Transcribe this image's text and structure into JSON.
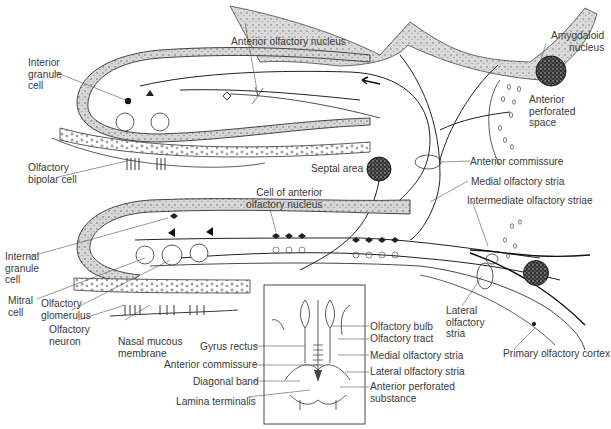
{
  "figure": {
    "background": "#ffffff",
    "ink": "#2a2a2a",
    "shade": "#d9d9d9"
  },
  "labels": {
    "anterior_olfactory_nucleus": "Anterior olfactory nucleus",
    "interior_granule_cell": [
      "Interior",
      "granule",
      "cell"
    ],
    "olfactory_bipolar_cell": [
      "Olfactory",
      "bipolar cell"
    ],
    "amygdaloid_nucleus": [
      "Amygdaloid",
      "nucleus"
    ],
    "anterior_perforated_space": [
      "Anterior",
      "perforated",
      "space"
    ],
    "septal_area": "Septal area",
    "anterior_commissure": "Anterior commissure",
    "medial_olfactory_stria": "Medial olfactory stria",
    "intermediate_olfactory_striae": "Intermediate olfactory striae",
    "cell_of_anterior_olfactory_nucleus": [
      "Cell of anterior",
      "olfactory nucleus"
    ],
    "internal_granule_cell": [
      "Internal",
      "granule",
      "cell"
    ],
    "mitral_cell": [
      "Mitral",
      "cell"
    ],
    "olfactory_glomerulus": [
      "Olfactory",
      "glomerulus"
    ],
    "olfactory_neuron": [
      "Olfactory",
      "neuron"
    ],
    "nasal_mucous_membrane": [
      "Nasal mucous",
      "membrane"
    ],
    "lateral_olfactory_stria": [
      "Lateral",
      "olfactory",
      "stria"
    ],
    "primary_olfactory_cortex": "Primary olfactory cortex"
  },
  "inset": {
    "left_labels": [
      "Gyrus rectus",
      "Anterior commissure",
      "Diagonal band",
      "Lamina terminalis"
    ],
    "right_labels": [
      "Olfactory bulb",
      "Olfactory tract",
      "Medial olfactory stria",
      "Lateral olfactory stria",
      "Anterior perforated",
      "substance"
    ]
  },
  "annotations": {
    "arrow": "arrow-left-icon"
  }
}
